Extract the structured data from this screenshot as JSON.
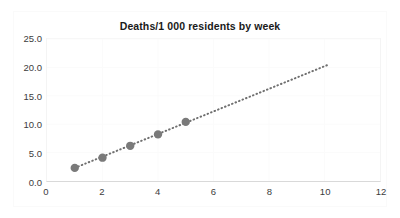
{
  "chart_data": {
    "type": "scatter",
    "title": "Deaths/1 000 residents by week",
    "xlabel": "",
    "ylabel": "",
    "x": [
      1,
      2,
      3,
      4,
      5
    ],
    "values": [
      2.3,
      4.1,
      6.2,
      8.2,
      10.4
    ],
    "series": [
      {
        "name": "Deaths per 1 000 residents",
        "x": [
          1,
          2,
          3,
          4,
          5
        ],
        "values": [
          2.3,
          4.1,
          6.2,
          8.2,
          10.4
        ],
        "marker": "circle",
        "color": "#7a7a7a"
      },
      {
        "name": "trendline",
        "style": "dotted",
        "color": "#6f6f6f",
        "x": [
          1,
          10.1
        ],
        "values": [
          2.3,
          20.4
        ]
      }
    ],
    "xlim": [
      0,
      12
    ],
    "ylim": [
      0,
      25
    ],
    "xticks": [
      0,
      2,
      4,
      6,
      8,
      10,
      12
    ],
    "yticks": [
      0,
      5,
      10,
      15,
      20,
      25
    ],
    "xtick_labels": [
      "0",
      "2",
      "4",
      "6",
      "8",
      "10",
      "12"
    ],
    "ytick_labels": [
      "0.0",
      "5.0",
      "10.0",
      "15.0",
      "20.0",
      "25.0"
    ],
    "grid": true,
    "legend": false,
    "background_color": "#ffffff",
    "grid_color": "#fbfbfb",
    "axis_color": "#d9d9d9",
    "text_color": "#3c3c3c",
    "title_color": "#1a1a1a"
  }
}
